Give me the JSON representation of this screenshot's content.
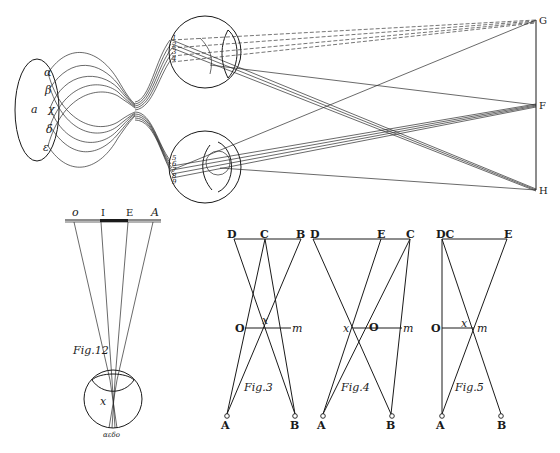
{
  "colors": {
    "ink": "#1a1a1a",
    "paper": "#ffffff"
  },
  "main_figure": {
    "brain_labels": {
      "center": "a",
      "alpha": "α",
      "beta": "β",
      "chi": "χ",
      "delta": "δ",
      "epsilon": "ε"
    },
    "right_points": {
      "top": "G",
      "middle": "F",
      "bottom": "H"
    },
    "upper_eye_labels": [
      "1",
      "2",
      "3",
      "4"
    ],
    "lower_eye_labels": [
      "5",
      "6",
      "7",
      "8",
      "9"
    ]
  },
  "fig12": {
    "caption": "Fig.12",
    "scale_labels": [
      "o",
      "I",
      "E",
      "A"
    ],
    "eye_center_label": "x",
    "retina_labels": "αεδο"
  },
  "fig3": {
    "caption": "Fig.3",
    "top_labels": [
      "D",
      "C",
      "B"
    ],
    "middle_labels": {
      "left": "O",
      "center": "x",
      "right": "m"
    },
    "bottom_labels": [
      "A",
      "B"
    ]
  },
  "fig4": {
    "caption": "Fig.4",
    "top_labels": [
      "D",
      "E",
      "C"
    ],
    "middle_labels": {
      "left": "x",
      "center": "O",
      "right": "m"
    },
    "bottom_labels": [
      "A",
      "B"
    ]
  },
  "fig5": {
    "caption": "Fig.5",
    "top_labels": [
      "DC",
      "E"
    ],
    "middle_labels": {
      "left": "O",
      "center": "x",
      "right": "m"
    },
    "bottom_labels": [
      "A",
      "B"
    ]
  }
}
